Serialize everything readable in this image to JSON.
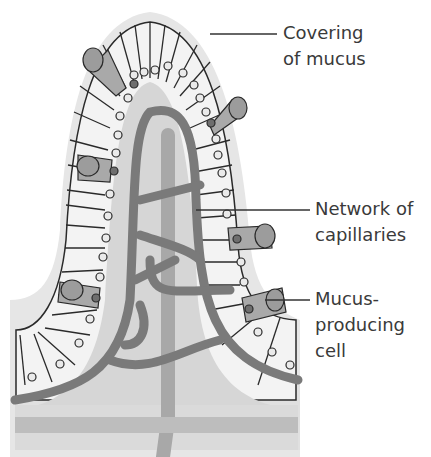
{
  "diagram": {
    "labels": [
      {
        "id": "mucus-covering",
        "line1": "Covering",
        "line2": "of mucus",
        "line3": ""
      },
      {
        "id": "capillaries",
        "line1": "Network of",
        "line2": "capillaries",
        "line3": ""
      },
      {
        "id": "mucus-cell",
        "line1": "Mucus-",
        "line2": "producing",
        "line3": "cell"
      }
    ],
    "colors": {
      "background": "#ffffff",
      "mucus_layer": "#e6e6e6",
      "epithelial_cell": "#f3f3f3",
      "cell_outline": "#2a2a2a",
      "core": "#d6d6d6",
      "capillary": "#7a7a7a",
      "lacteal": "#a8a8a8",
      "mucus_cell": "#a9a9a9",
      "mucus_blob": "#9c9c9c"
    }
  }
}
